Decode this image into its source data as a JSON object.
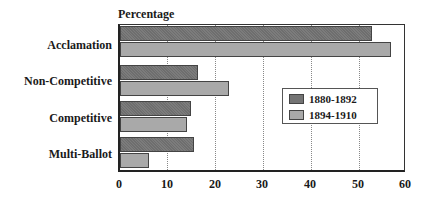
{
  "chart_data": {
    "type": "bar",
    "orientation": "horizontal",
    "title": "",
    "xlabel": "",
    "ylabel": "Percentage",
    "categories": [
      "Acclamation",
      "Non-Competitive",
      "Competitive",
      "Multi-Ballot"
    ],
    "series": [
      {
        "name": "1880-1892",
        "color": "#747474",
        "values": [
          53,
          16.5,
          15,
          15.5
        ]
      },
      {
        "name": "1894-1910",
        "color": "#a9a9a9",
        "values": [
          57,
          23,
          14,
          6
        ]
      }
    ],
    "xlim": [
      0,
      60
    ],
    "xticks": [
      "0",
      "10",
      "20",
      "30",
      "40",
      "50",
      "60"
    ],
    "grid": "vertical dotted",
    "legend_position": "inside right-center"
  }
}
